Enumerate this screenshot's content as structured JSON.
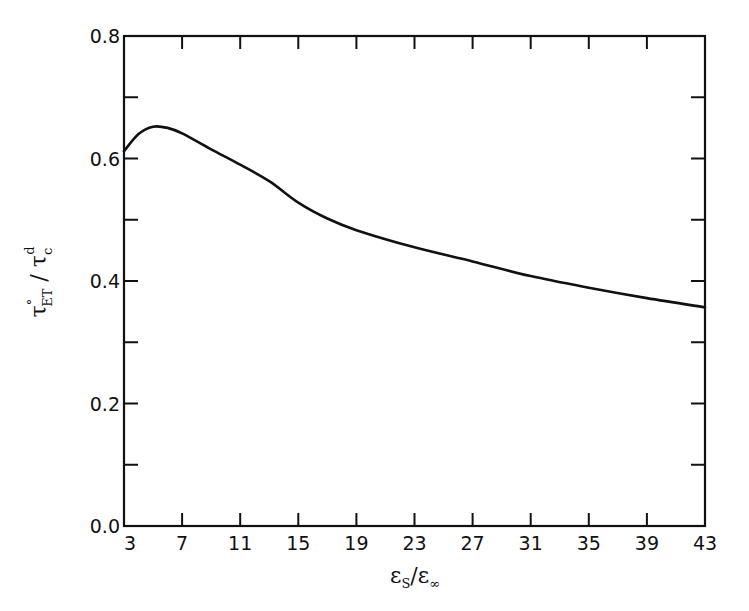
{
  "chart_data": {
    "type": "line",
    "title": "",
    "xlabel": "εS/ε∞",
    "ylabel": "τ°ET / τcd",
    "xlabel_parts": {
      "main": "ε",
      "sub": "S",
      "sep": "/",
      "main2": "ε",
      "sub2": "∞"
    },
    "ylabel_parts": {
      "main": "τ",
      "sup": "°",
      "sub": "ET",
      "sep": "/",
      "main2": "τ",
      "sub2": "c",
      "sup2": "d"
    },
    "xlim": [
      3,
      43
    ],
    "ylim": [
      0.0,
      0.8
    ],
    "xticks": [
      3,
      7,
      11,
      15,
      19,
      23,
      27,
      31,
      35,
      39,
      43
    ],
    "xtick_labels": [
      "3",
      "7",
      "11",
      "15",
      "19",
      "23",
      "27",
      "31",
      "35",
      "39",
      "43"
    ],
    "yticks": [
      0.0,
      0.2,
      0.4,
      0.6,
      0.8
    ],
    "ytick_labels": [
      "0.0",
      "0.2",
      "0.4",
      "0.6",
      "0.8"
    ],
    "y_minor_ticks": [
      0.1,
      0.3,
      0.5,
      0.7
    ],
    "grid": false,
    "legend": null,
    "series": [
      {
        "name": "τ°ET/τcd",
        "color": "#111111",
        "x": [
          3,
          4,
          5,
          6,
          7,
          9,
          11,
          13,
          15,
          17,
          19,
          23,
          27,
          31,
          35,
          39,
          43
        ],
        "y": [
          0.612,
          0.64,
          0.652,
          0.65,
          0.641,
          0.615,
          0.59,
          0.563,
          0.528,
          0.502,
          0.483,
          0.455,
          0.432,
          0.408,
          0.389,
          0.372,
          0.357
        ]
      }
    ]
  }
}
